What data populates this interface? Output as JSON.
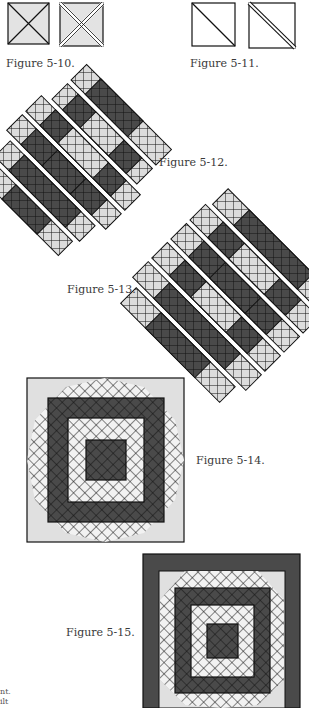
{
  "figures": [
    {
      "id": "5-10",
      "label": "Figure 5-10."
    },
    {
      "id": "5-11",
      "label": "Figure 5-11."
    },
    {
      "id": "5-12",
      "label": "Figure 5-12."
    },
    {
      "id": "5-13",
      "label": "Figure 5-13."
    },
    {
      "id": "5-14",
      "label": "Figure 5-14."
    },
    {
      "id": "5-15",
      "label": "Figure 5-15."
    }
  ],
  "text_fragments": [
    "nt.",
    "ilt"
  ],
  "colors": {
    "light": "#e0e0e0",
    "dark": "#4a4a4a",
    "outline": "#111111",
    "white": "#ffffff"
  }
}
